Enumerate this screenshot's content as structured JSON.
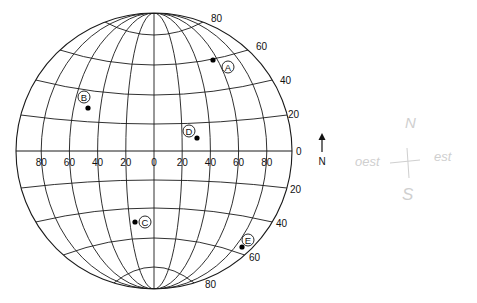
{
  "globe": {
    "center": [
      154,
      151
    ],
    "radius": 138,
    "line_color": "#1a1a1a",
    "meridian_labels": [
      "80",
      "60",
      "40",
      "20",
      "0",
      "20",
      "40",
      "60",
      "80"
    ],
    "parallel_labels_north": [
      "80",
      "60",
      "40",
      "20"
    ],
    "equator_label": "0",
    "parallel_labels_south": [
      "20",
      "40",
      "60",
      "80"
    ]
  },
  "points": [
    {
      "id": "A",
      "label": "A",
      "dot": [
        213,
        60
      ],
      "tag": [
        228,
        67
      ]
    },
    {
      "id": "B",
      "label": "B",
      "dot": [
        88,
        108
      ],
      "tag": [
        84,
        97
      ]
    },
    {
      "id": "C",
      "label": "C",
      "dot": [
        135,
        222
      ],
      "tag": [
        145,
        222
      ]
    },
    {
      "id": "D",
      "label": "D",
      "dot": [
        197,
        138
      ],
      "tag": [
        189,
        131
      ]
    },
    {
      "id": "E",
      "label": "E",
      "dot": [
        242,
        247
      ],
      "tag": [
        248,
        240
      ]
    }
  ],
  "north_arrow": {
    "label": "N"
  },
  "handwriting": {
    "top": "N",
    "left": "oest",
    "right": "est",
    "bottom": "S",
    "color": "#c8c8c8"
  }
}
